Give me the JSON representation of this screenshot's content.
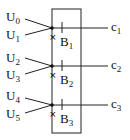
{
  "inputs": [
    {
      "label": "U",
      "sub": "0"
    },
    {
      "label": "U",
      "sub": "1"
    },
    {
      "label": "U",
      "sub": "2"
    },
    {
      "label": "U",
      "sub": "3"
    },
    {
      "label": "U",
      "sub": "4"
    },
    {
      "label": "U",
      "sub": "5"
    }
  ],
  "blocks": [
    {
      "label": "B",
      "sub": "1"
    },
    {
      "label": "B",
      "sub": "2"
    },
    {
      "label": "B",
      "sub": "3"
    }
  ],
  "outputs": [
    {
      "label": "c",
      "sub": "1"
    },
    {
      "label": "c",
      "sub": "2"
    },
    {
      "label": "c",
      "sub": "3"
    }
  ]
}
